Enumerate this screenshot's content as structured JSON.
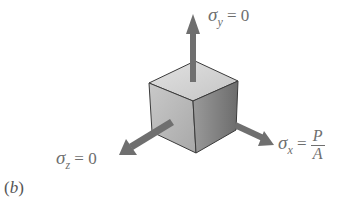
{
  "figure": {
    "caption": "(b)",
    "caption_letter": "b",
    "labels": {
      "sigma_y": {
        "symbol": "σ",
        "subscript": "y",
        "relation": "= 0"
      },
      "sigma_x": {
        "symbol": "σ",
        "subscript": "x",
        "relation": "=",
        "numerator": "P",
        "denominator": "A"
      },
      "sigma_z": {
        "symbol": "σ",
        "subscript": "z",
        "relation": "= 0"
      }
    },
    "colors": {
      "arrow": "#6f6f6f",
      "text": "#6e6e6e",
      "cube_top": "#d4d4d4",
      "cube_left": "#bdbdbd",
      "cube_right": "#8a8a8a",
      "edge": "#3a3a3a"
    }
  }
}
